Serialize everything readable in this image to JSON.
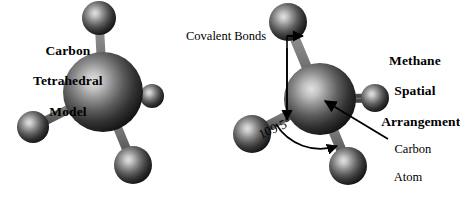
{
  "figure": {
    "background_color": "#ffffff",
    "atom_color_core": "#d6d6d6",
    "atom_color_edge": "#141414",
    "bond_color": "#6b6b6b",
    "bond_edge_color": "#3a3a3a",
    "annotation_color": "#000000"
  },
  "left_model": {
    "title_line1": "Carbon",
    "title_line2": "Tetrahedral",
    "title_line3": "Model",
    "center_atom_name": "carbon-atom",
    "hydrogen_count": 4
  },
  "right_model": {
    "title_line1": "Methane",
    "title_line2": "Spatial",
    "title_line3": "Arrangement",
    "center_atom_name": "carbon-atom",
    "hydrogen_count": 4
  },
  "annotations": {
    "covalent_bonds_label": "Covalent Bonds",
    "bond_angle_label": "109.5°",
    "carbon_atom_label_line1": "Carbon",
    "carbon_atom_label_line2": "Atom"
  }
}
